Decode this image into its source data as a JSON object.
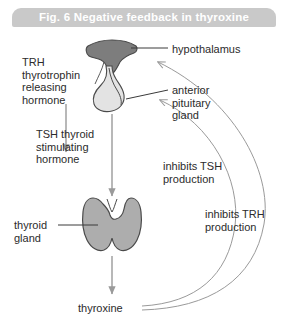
{
  "figure": {
    "title": "Fig. 6  Negative feedback in thyroxine",
    "title_bar_color": "#c9c9c9",
    "title_text_color": "#ffffff",
    "background_color": "#ffffff",
    "width": 288,
    "height": 330
  },
  "colors": {
    "hypothalamus_fill": "#7d7d7d",
    "pituitary_fill": "#e3e3e3",
    "thyroid_fill": "#adadad",
    "outline": "#4a4a4a",
    "arrow": "#9a9a9a",
    "leader_line": "#3a3a3a",
    "text": "#2b2b2b"
  },
  "labels": {
    "trh": "TRH\nthyrotrophin\nreleasing\nhormone",
    "tsh": "TSH thyroid\nstimulating\nhormone",
    "thyroid_gland": "thyroid\ngland",
    "hypothalamus": "hypothalamus",
    "anterior_pituitary": "anterior\npituitary\ngland",
    "inhibits_tsh": "inhibits TSH\nproduction",
    "inhibits_trh": "inhibits TRH\nproduction",
    "thyroxine": "thyroxine"
  },
  "structures": [
    {
      "name": "hypothalamus",
      "label": "hypothalamus",
      "fill": "#7d7d7d"
    },
    {
      "name": "anterior-pituitary-gland",
      "label": "anterior pituitary gland",
      "fill": "#e3e3e3"
    },
    {
      "name": "thyroid-gland",
      "label": "thyroid gland",
      "fill": "#adadad"
    }
  ],
  "flows": [
    {
      "name": "trh-arrow",
      "from": "hypothalamus",
      "to": "anterior pituitary gland",
      "hormone": "TRH thyrotrophin releasing hormone",
      "effect": "stimulates"
    },
    {
      "name": "tsh-arrow",
      "from": "anterior pituitary gland",
      "to": "thyroid gland",
      "hormone": "TSH thyroid stimulating hormone",
      "effect": "stimulates"
    },
    {
      "name": "thyroxine-arrow",
      "from": "thyroid gland",
      "to": "thyroxine",
      "hormone": "thyroxine",
      "effect": "secretes"
    },
    {
      "name": "feedback-tsh",
      "from": "thyroxine",
      "to": "anterior pituitary gland",
      "effect": "inhibits TSH production"
    },
    {
      "name": "feedback-trh",
      "from": "thyroxine",
      "to": "hypothalamus",
      "effect": "inhibits TRH production"
    }
  ]
}
